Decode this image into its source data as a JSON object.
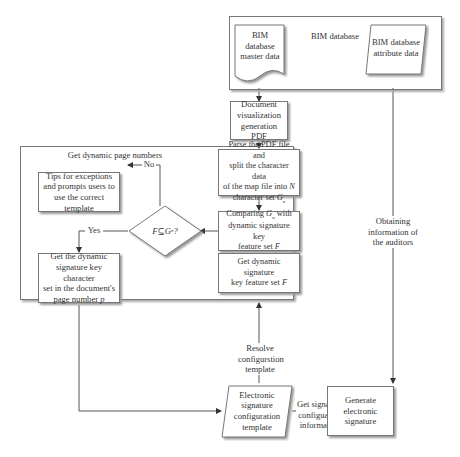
{
  "diagram": {
    "groups": {
      "bim_database": "BIM database",
      "dynamic_page_numbers": "Get dynamic page numbers"
    },
    "nodes": {
      "master_data": "BIM database master data",
      "attribute_data": "BIM database attribute data",
      "doc_visualization": "Document visualization generation PDF",
      "parse_pdf": "Parse the PDF file and split the character data of the map file into N character set Gn",
      "compare": "Comparing Gn with dynamic signature key feature set F",
      "get_feature_set": "Get dynamic signature key feature set F",
      "decision": "F⊆Gn?",
      "tips": "Tips for exceptions and prompts users to use the correct template",
      "get_char_set": "Get the dynamic signature key character set in the document's page number p",
      "config_template": "Electronic signature configuration template",
      "generate": "Generate electronic signature"
    },
    "edge_labels": {
      "no": "No",
      "yes": "Yes",
      "resolve": "Resolve configurstion template",
      "get_config": "Get signature configuation information",
      "obtaining": "Obtaining information of the auditors"
    },
    "text_parts": {
      "parse_pdf_l1": "Parse the PDF file and",
      "parse_pdf_l2": "split the character data",
      "parse_pdf_l3": "of the map file into",
      "parse_pdf_N": "N",
      "parse_pdf_l4": "character set",
      "G": "G",
      "sub_n": "n",
      "compare_l1": "Comparing",
      "compare_l1b": "with",
      "compare_l2": "dynamic signature key",
      "compare_l3": "feature set",
      "F": "F",
      "getfs_l1": "Get dynamic signature",
      "getfs_l2": "key feature set",
      "dec_F": "F",
      "dec_sub": "⊆",
      "dec_q": "?",
      "charset_l1": "Get the dynamic",
      "charset_l2": "signature key character",
      "charset_l3": "set in the document's",
      "charset_l4": "page number",
      "p": "p"
    }
  }
}
